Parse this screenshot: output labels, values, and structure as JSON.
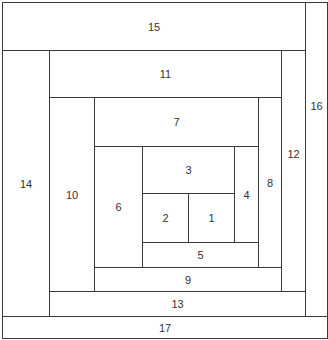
{
  "diagram": {
    "title": "",
    "type": "log-cabin spiral block layout",
    "stroke_color": "#3a3a3a",
    "background": "#ffffff",
    "blocks": [
      {
        "label": "15",
        "x": 2,
        "y": 2,
        "w": 304,
        "h": 49
      },
      {
        "label": "16",
        "x": 305,
        "y": 2,
        "w": 23,
        "h": 315
      },
      {
        "label": "14",
        "x": 2,
        "y": 50,
        "w": 48,
        "h": 267
      },
      {
        "label": "11",
        "x": 49,
        "y": 50,
        "w": 233,
        "h": 48
      },
      {
        "label": "12",
        "x": 281,
        "y": 50,
        "w": 25,
        "h": 242
      },
      {
        "label": "10",
        "x": 49,
        "y": 97,
        "w": 46,
        "h": 195
      },
      {
        "label": "7",
        "x": 94,
        "y": 97,
        "w": 165,
        "h": 50
      },
      {
        "label": "8",
        "x": 258,
        "y": 97,
        "w": 24,
        "h": 171
      },
      {
        "label": "6",
        "x": 94,
        "y": 146,
        "w": 49,
        "h": 122
      },
      {
        "label": "3",
        "x": 142,
        "y": 146,
        "w": 93,
        "h": 48
      },
      {
        "label": "4",
        "x": 234,
        "y": 146,
        "w": 25,
        "h": 97
      },
      {
        "label": "2",
        "x": 142,
        "y": 193,
        "w": 47,
        "h": 50
      },
      {
        "label": "1",
        "x": 188,
        "y": 193,
        "w": 47,
        "h": 50
      },
      {
        "label": "5",
        "x": 142,
        "y": 242,
        "w": 117,
        "h": 26
      },
      {
        "label": "9",
        "x": 94,
        "y": 267,
        "w": 188,
        "h": 25
      },
      {
        "label": "13",
        "x": 49,
        "y": 291,
        "w": 257,
        "h": 26
      },
      {
        "label": "17",
        "x": 2,
        "y": 316,
        "w": 326,
        "h": 23
      }
    ]
  }
}
